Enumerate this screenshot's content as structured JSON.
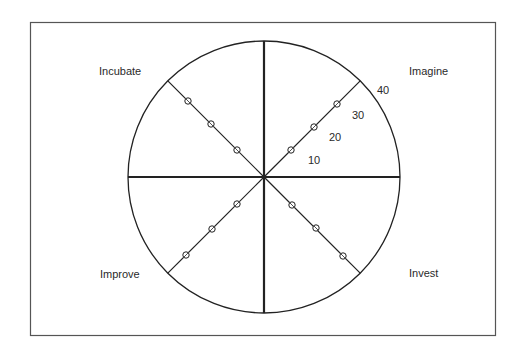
{
  "diagram": {
    "type": "circular-quadrant-model",
    "center": [
      264,
      177
    ],
    "radius": 136,
    "frame": {
      "x": 30,
      "y": 22,
      "width": 466,
      "height": 314
    },
    "quadrants": [
      {
        "id": "imagine",
        "label": "Imagine",
        "position": "top-right",
        "label_xy": [
          435,
          74
        ]
      },
      {
        "id": "incubate",
        "label": "Incubate",
        "position": "top-left",
        "label_xy": [
          100,
          74
        ]
      },
      {
        "id": "improve",
        "label": "Improve",
        "position": "bottom-left",
        "label_xy": [
          100,
          278
        ]
      },
      {
        "id": "invest",
        "label": "Invest",
        "position": "bottom-right",
        "label_xy": [
          428,
          278
        ]
      }
    ],
    "scale": {
      "ticks": [
        "10",
        "20",
        "30",
        "40"
      ],
      "tick_markers_per_spoke": 3
    }
  },
  "colors": {
    "line": "#222222",
    "frame": "#555555",
    "background": "#ffffff",
    "text": "#2a2a2a"
  }
}
